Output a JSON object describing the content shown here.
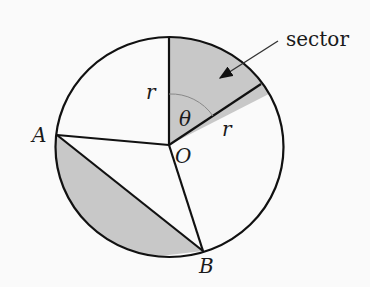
{
  "diagram": {
    "labels": {
      "sector": "sector",
      "r_vertical": "r",
      "r_slanted": "r",
      "theta": "θ",
      "center": "O",
      "point_a": "A",
      "point_b": "B"
    },
    "colors": {
      "shade": "#c8c8c8",
      "stroke": "#111111",
      "background": "#fafafa",
      "angle_arc": "#888888"
    }
  }
}
